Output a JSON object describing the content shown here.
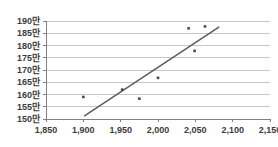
{
  "chart_data": {
    "type": "scatter",
    "title": "",
    "xlabel": "",
    "ylabel": "",
    "xlim": [
      1850,
      2150
    ],
    "ylim": [
      1500000,
      1900000
    ],
    "grid": true,
    "legend": false,
    "x_ticks": [
      1850,
      1900,
      1950,
      2000,
      2050,
      2100,
      2150
    ],
    "x_tick_labels": [
      "1,850",
      "1,900",
      "1,950",
      "2,000",
      "2,050",
      "2,100",
      "2,150"
    ],
    "y_ticks": [
      1500000,
      1550000,
      1600000,
      1650000,
      1700000,
      1750000,
      1800000,
      1850000,
      1900000
    ],
    "y_tick_labels": [
      "150만",
      "155만",
      "160만",
      "165만",
      "170만",
      "175만",
      "180만",
      "185만",
      "190만"
    ],
    "series": [
      {
        "name": "data-points",
        "marker": "square",
        "color": "#4a4a4a",
        "points": [
          {
            "x": 1900,
            "y": 1590000
          },
          {
            "x": 1952,
            "y": 1620000
          },
          {
            "x": 1975,
            "y": 1583000
          },
          {
            "x": 2000,
            "y": 1668000
          },
          {
            "x": 2041,
            "y": 1870000
          },
          {
            "x": 2049,
            "y": 1778000
          },
          {
            "x": 2063,
            "y": 1878000
          }
        ]
      }
    ],
    "trendline": {
      "name": "linear-trendline",
      "color": "#595959",
      "x_start": 1901,
      "y_start": 1512000,
      "x_end": 2082,
      "y_end": 1876000
    },
    "colors": {
      "grid": "#c8c8c8",
      "axis": "#808080",
      "marker": "#4a4a4a",
      "trendline": "#595959",
      "tick_text": "#3c3c3c",
      "background": "#ffffff"
    }
  }
}
